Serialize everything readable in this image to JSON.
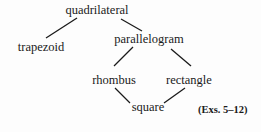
{
  "diagram": {
    "type": "hierarchy",
    "nodes": [
      {
        "id": "quadrilateral",
        "label": "quadrilateral",
        "cx": 97,
        "top": 3
      },
      {
        "id": "trapezoid",
        "label": "trapezoid",
        "cx": 41,
        "top": 40
      },
      {
        "id": "parallelogram",
        "label": "parallelogram",
        "cx": 149,
        "top": 32
      },
      {
        "id": "rhombus",
        "label": "rhombus",
        "cx": 114,
        "top": 73
      },
      {
        "id": "rectangle",
        "label": "rectangle",
        "cx": 189,
        "top": 73
      },
      {
        "id": "square",
        "label": "square",
        "cx": 148,
        "top": 100
      }
    ],
    "edges": [
      {
        "from": "quadrilateral",
        "to": "trapezoid",
        "x1": 77,
        "y1": 18,
        "x2": 46,
        "y2": 38
      },
      {
        "from": "quadrilateral",
        "to": "parallelogram",
        "x1": 121,
        "y1": 19,
        "x2": 142,
        "y2": 31
      },
      {
        "from": "parallelogram",
        "to": "rhombus",
        "x1": 133,
        "y1": 47,
        "x2": 114,
        "y2": 66
      },
      {
        "from": "parallelogram",
        "to": "rectangle",
        "x1": 171,
        "y1": 49,
        "x2": 191,
        "y2": 66
      },
      {
        "from": "rhombus",
        "to": "square",
        "x1": 115,
        "y1": 88,
        "x2": 130,
        "y2": 103
      },
      {
        "from": "rectangle",
        "to": "square",
        "x1": 185,
        "y1": 88,
        "x2": 164,
        "y2": 103
      }
    ],
    "note": "(Exs. 5–12)",
    "line_color": "#1a1a1a"
  }
}
